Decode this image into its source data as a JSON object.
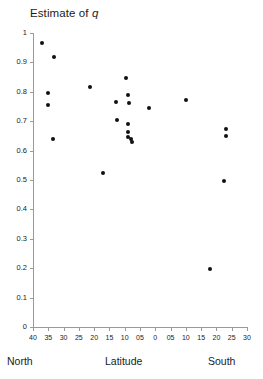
{
  "chart_data": {
    "type": "scatter",
    "title": "Estimate of q",
    "title_plain": "Estimate of ",
    "title_italic": "q",
    "xlabel": "Latitude",
    "ylabel": "",
    "x_left_label": "North",
    "x_right_label": "South",
    "xlim": [
      40,
      -30
    ],
    "ylim": [
      0,
      1
    ],
    "grid": false,
    "legend": null,
    "x_tick_labels": [
      "40",
      "35",
      "30",
      "25",
      "20",
      "15",
      "10",
      "05",
      "0",
      "05",
      "10",
      "15",
      "20",
      "25",
      "30"
    ],
    "x_tick_values": [
      40,
      35,
      30,
      25,
      20,
      15,
      10,
      5,
      0,
      -5,
      -10,
      -15,
      -20,
      -25,
      -30
    ],
    "y_tick_labels": [
      "1",
      "0.9",
      "0.8",
      "0.7",
      "0.6",
      "0.5",
      "0.4",
      "0.3",
      "0.2",
      "0.1",
      "0"
    ],
    "y_tick_values": [
      1,
      0.9,
      0.8,
      0.7,
      0.6,
      0.5,
      0.4,
      0.3,
      0.2,
      0.1,
      0
    ],
    "point_color": "#111111",
    "axis_color": "#9a9a9a",
    "points": [
      {
        "x": 37.0,
        "y": 0.965
      },
      {
        "x": 33.0,
        "y": 0.918
      },
      {
        "x": 35.0,
        "y": 0.795
      },
      {
        "x": 35.0,
        "y": 0.755
      },
      {
        "x": 33.5,
        "y": 0.64
      },
      {
        "x": 21.5,
        "y": 0.815
      },
      {
        "x": 17.0,
        "y": 0.525
      },
      {
        "x": 13.0,
        "y": 0.765
      },
      {
        "x": 9.5,
        "y": 0.848
      },
      {
        "x": 9.0,
        "y": 0.79
      },
      {
        "x": 8.5,
        "y": 0.762
      },
      {
        "x": 12.5,
        "y": 0.705
      },
      {
        "x": 9.0,
        "y": 0.69
      },
      {
        "x": 8.8,
        "y": 0.662
      },
      {
        "x": 8.8,
        "y": 0.645
      },
      {
        "x": 8.0,
        "y": 0.64
      },
      {
        "x": 7.6,
        "y": 0.628
      },
      {
        "x": 2.0,
        "y": 0.745
      },
      {
        "x": -10.0,
        "y": 0.772
      },
      {
        "x": -23.0,
        "y": 0.672
      },
      {
        "x": -23.0,
        "y": 0.65
      },
      {
        "x": -22.5,
        "y": 0.495
      },
      {
        "x": -18.0,
        "y": 0.197
      }
    ]
  }
}
